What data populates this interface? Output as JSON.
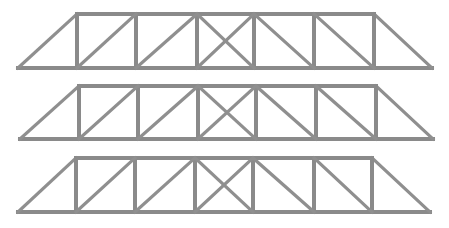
{
  "diagram": {
    "type": "truss-bridge-elevations",
    "count": 3,
    "member_color": "#8a8a8a",
    "background": "#ffffff",
    "trusses": [
      {
        "name": "truss-1",
        "top_y": 14,
        "bottom_y": 68,
        "left_tip": 18,
        "right_tip": 432,
        "verticals": [
          77,
          136,
          197,
          254,
          314,
          374
        ]
      },
      {
        "name": "truss-2",
        "top_y": 86,
        "bottom_y": 139,
        "left_tip": 20,
        "right_tip": 433,
        "verticals": [
          79,
          138,
          198,
          256,
          316,
          376
        ]
      },
      {
        "name": "truss-3",
        "top_y": 158,
        "bottom_y": 212,
        "left_tip": 18,
        "right_tip": 430,
        "verticals": [
          76,
          135,
          195,
          253,
          314,
          372
        ]
      }
    ],
    "panel_pattern": [
      "diag-up-right",
      "diag-up-right",
      "x-brace",
      "diag-down-right",
      "diag-down-right"
    ]
  }
}
